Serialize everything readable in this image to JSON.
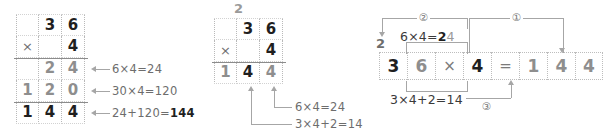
{
  "figure": {
    "colors": {
      "ink": "#1f1f1f",
      "gray": "#8e8e8e",
      "light_gray": "#a6a6a6",
      "rule": "#8c8c8c",
      "dotted": "#bdbdbd",
      "background": "#ffffff"
    }
  },
  "panel_left": {
    "name": "vertical-long-multiplication-expanded",
    "rows": [
      {
        "name": "multiplicand-row",
        "cells": [
          {
            "text": "",
            "style": "blank"
          },
          {
            "text": "3",
            "style": "dark"
          },
          {
            "text": "6",
            "style": "dark"
          }
        ]
      },
      {
        "name": "multiplier-row",
        "cells": [
          {
            "text": "×",
            "style": "op"
          },
          {
            "text": "",
            "style": "blank"
          },
          {
            "text": "4",
            "style": "dark"
          }
        ]
      },
      {
        "name": "partial-product-ones-row",
        "cells": [
          {
            "text": "",
            "style": "blank"
          },
          {
            "text": "2",
            "style": "gray"
          },
          {
            "text": "4",
            "style": "gray"
          }
        ]
      },
      {
        "name": "partial-product-tens-row",
        "cells": [
          {
            "text": "1",
            "style": "gray"
          },
          {
            "text": "2",
            "style": "gray"
          },
          {
            "text": "0",
            "style": "gray"
          }
        ]
      },
      {
        "name": "total-row",
        "cells": [
          {
            "text": "1",
            "style": "dark"
          },
          {
            "text": "4",
            "style": "dark"
          },
          {
            "text": "4",
            "style": "dark"
          }
        ]
      }
    ],
    "annotations": [
      {
        "name": "annotation-ones",
        "parts": [
          {
            "text": "6",
            "emphasis": "normal"
          },
          {
            "text": "×",
            "emphasis": "normal"
          },
          {
            "text": "4",
            "emphasis": "normal"
          },
          {
            "text": "=",
            "emphasis": "normal"
          },
          {
            "text": "24",
            "emphasis": "normal"
          }
        ],
        "full": "6×4=24"
      },
      {
        "name": "annotation-tens",
        "parts": [
          {
            "text": "30×4=120",
            "emphasis": "normal"
          }
        ],
        "full": "30×4=120"
      },
      {
        "name": "annotation-sum",
        "prefix": "24+120=",
        "bold": "144",
        "full": "24+120=144"
      }
    ]
  },
  "panel_middle": {
    "name": "vertical-long-multiplication-compact",
    "carry": "2",
    "rows": [
      {
        "name": "multiplicand-row",
        "cells": [
          {
            "text": "",
            "style": "blank"
          },
          {
            "text": "3",
            "style": "dark"
          },
          {
            "text": "6",
            "style": "dark"
          }
        ]
      },
      {
        "name": "multiplier-row",
        "cells": [
          {
            "text": "×",
            "style": "op"
          },
          {
            "text": "",
            "style": "blank"
          },
          {
            "text": "4",
            "style": "dark"
          }
        ]
      },
      {
        "name": "product-row",
        "cells": [
          {
            "text": "1",
            "style": "gray"
          },
          {
            "text": "4",
            "style": "dark"
          },
          {
            "text": "4",
            "style": "gray"
          }
        ]
      }
    ],
    "annotations": [
      {
        "name": "annotation-ones-digit",
        "text": "6×4=24"
      },
      {
        "name": "annotation-tens-digit",
        "text": "3×4+2=14"
      }
    ]
  },
  "panel_right": {
    "name": "horizontal-multiplication-steps",
    "carry": "2",
    "cells": [
      {
        "text": "3",
        "style": "dark",
        "name": "digit-3"
      },
      {
        "text": "6",
        "style": "gray",
        "name": "digit-6"
      },
      {
        "text": "×",
        "style": "op",
        "name": "times-sign"
      },
      {
        "text": "4",
        "style": "dark",
        "name": "digit-4"
      },
      {
        "text": "=",
        "style": "op",
        "name": "equals-sign"
      },
      {
        "text": "1",
        "style": "gray",
        "name": "result-hundreds"
      },
      {
        "text": "4",
        "style": "gray",
        "name": "result-tens"
      },
      {
        "text": "4",
        "style": "gray",
        "name": "result-ones"
      }
    ],
    "step_labels": [
      {
        "name": "step-1",
        "text": "①"
      },
      {
        "name": "step-2",
        "text": "②"
      },
      {
        "name": "step-3",
        "text": "③"
      }
    ],
    "annotations": [
      {
        "name": "annotation-top",
        "prefix": "6×4=",
        "bold": "2",
        "light": "4",
        "full": "6×4=24"
      },
      {
        "name": "annotation-bottom",
        "text": "3×4+2=14"
      }
    ]
  }
}
